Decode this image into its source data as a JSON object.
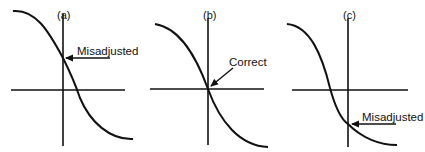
{
  "figure": {
    "panels": [
      {
        "id": "a",
        "label": "(a)",
        "annotation": "Misadjusted",
        "state": "misadjusted-high"
      },
      {
        "id": "b",
        "label": "(b)",
        "annotation": "Correct",
        "state": "correct"
      },
      {
        "id": "c",
        "label": "(c)",
        "annotation": "Misadjusted",
        "state": "misadjusted-low"
      }
    ],
    "colors": {
      "line": "#111111",
      "background": "#ffffff"
    }
  }
}
